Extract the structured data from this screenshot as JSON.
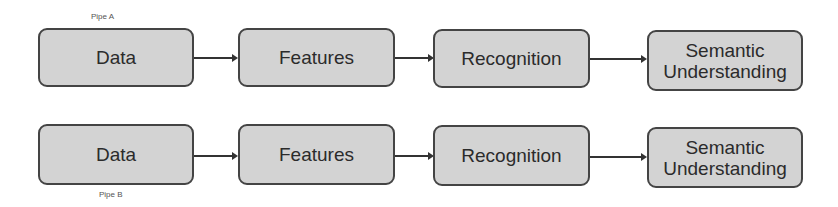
{
  "pipelines": [
    {
      "label": "Pipe A",
      "stages": [
        {
          "label": "Data"
        },
        {
          "label": "Features"
        },
        {
          "label": "Recognition"
        },
        {
          "label": "Semantic Understanding"
        }
      ]
    },
    {
      "label": "Pipe B",
      "stages": [
        {
          "label": "Data"
        },
        {
          "label": "Features"
        },
        {
          "label": "Recognition"
        },
        {
          "label": "Semantic Understanding"
        }
      ]
    }
  ],
  "colors": {
    "box_fill": "#d3d3d3",
    "box_border": "#444444",
    "arrow": "#333333",
    "text": "#2b2b2b"
  }
}
